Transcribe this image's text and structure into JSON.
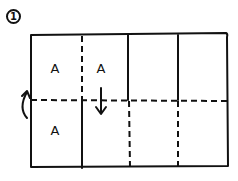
{
  "step_number": "1",
  "panel_labels": [
    {
      "text": "A",
      "x": 55,
      "y": 68
    },
    {
      "text": "A",
      "x": 101,
      "y": 68
    },
    {
      "text": "A",
      "x": 55,
      "y": 130
    }
  ],
  "diagram": {
    "stroke_color": "#111111",
    "outer_rect": {
      "x1": 31,
      "y1": 35,
      "x2": 227,
      "y2": 168
    },
    "fold_lines": {
      "valley_dashed": [
        "horizontal center y=100",
        "top-left vertical x=82",
        "bottom verticals x=128 and x=178"
      ],
      "solid": [
        "bottom vertical x=82",
        "top verticals x=128 and x=178"
      ]
    },
    "arrows": [
      {
        "type": "curved-fold-arrow",
        "location": "left edge near center line"
      },
      {
        "type": "down-arrow",
        "location": "column 2 crossing center line"
      }
    ]
  }
}
